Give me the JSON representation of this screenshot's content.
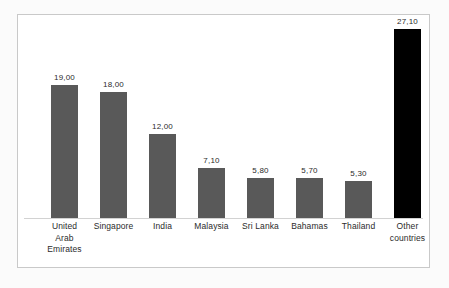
{
  "chart_data": {
    "type": "bar",
    "title": "",
    "subtitle": "",
    "xlabel": "",
    "ylabel": "",
    "grid": false,
    "legend": "none",
    "ylim": [
      0,
      27.1
    ],
    "decimal_separator": ",",
    "categories": [
      "United Arab Emirates",
      "Singapore",
      "India",
      "Malaysia",
      "Sri Lanka",
      "Bahamas",
      "Thailand",
      "Other countries"
    ],
    "category_lines": [
      [
        "United",
        "Arab",
        "Emirates"
      ],
      [
        "Singapore"
      ],
      [
        "India"
      ],
      [
        "Malaysia"
      ],
      [
        "Sri Lanka"
      ],
      [
        "Bahamas"
      ],
      [
        "Thailand"
      ],
      [
        "Other",
        "countries"
      ]
    ],
    "values": [
      19.0,
      18.0,
      12.0,
      7.1,
      5.8,
      5.7,
      5.3,
      27.1
    ],
    "value_labels": [
      "19,00",
      "18,00",
      "12,00",
      "7,10",
      "5,80",
      "5,70",
      "5,30",
      "27,10"
    ],
    "bar_colors": [
      "#595959",
      "#595959",
      "#595959",
      "#595959",
      "#595959",
      "#595959",
      "#595959",
      "#000000"
    ]
  },
  "style": {
    "bar_gray": "#595959",
    "bar_black": "#000000",
    "frame_border": "#c9c9c9",
    "baseline": "#d2d2d2",
    "text": "#2b2b2b",
    "plot_background": "#ffffff",
    "page_background": "#fbfbfb"
  }
}
